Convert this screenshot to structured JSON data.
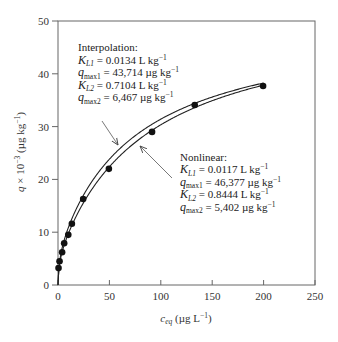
{
  "chart_data": {
    "type": "scatter",
    "title": "",
    "xlabel": "c_eq (µg L⁻¹)",
    "ylabel": "q × 10⁻³ (µg kg⁻¹)",
    "xlim": [
      0,
      250
    ],
    "ylim": [
      0,
      50
    ],
    "x_ticks": [
      0,
      50,
      100,
      150,
      200,
      250
    ],
    "y_ticks": [
      0,
      10,
      20,
      30,
      40,
      50
    ],
    "grid": false,
    "legend": "none (inline annotations with arrows)",
    "series": [
      {
        "name": "Observed data",
        "kind": "points",
        "x": [
          0.5,
          1.5,
          4,
          6,
          10,
          13.5,
          24.5,
          49.5,
          91.5,
          133,
          199.5
        ],
        "y": [
          3.2,
          4.5,
          6.2,
          7.9,
          9.5,
          11.6,
          16.3,
          22.0,
          29.0,
          34.1,
          37.7
        ]
      },
      {
        "name": "Interpolation",
        "kind": "curve",
        "model": "two-site Langmuir",
        "params": {
          "KL1": 0.0134,
          "qmax1": 43.714,
          "KL2": 0.7104,
          "qmax2": 6.467
        },
        "x_range": [
          0,
          200
        ]
      },
      {
        "name": "Nonlinear",
        "kind": "curve",
        "model": "two-site Langmuir",
        "params": {
          "KL1": 0.0117,
          "qmax1": 46.377,
          "KL2": 0.8444,
          "qmax2": 5.402
        },
        "x_range": [
          0,
          200
        ]
      }
    ],
    "annotations": [
      {
        "title": "Interpolation:",
        "lines": [
          {
            "sym": "K",
            "sub": "L1",
            "val": " = 0.0134 L kg",
            "sup": "−1"
          },
          {
            "sym": "q",
            "sub": "max1",
            "val": " = 43,714 µg kg",
            "sup": "−1"
          },
          {
            "sym": "K",
            "sub": "L2",
            "val": " = 0.7104 L kg",
            "sup": "−1"
          },
          {
            "sym": "q",
            "sub": "max2",
            "val": " = 6,467 µg kg",
            "sup": "−1"
          }
        ]
      },
      {
        "title": "Nonlinear:",
        "lines": [
          {
            "sym": "K",
            "sub": "L1",
            "val": " = 0.0117 L kg",
            "sup": "−1"
          },
          {
            "sym": "q",
            "sub": "max1",
            "val": " = 46,377 µg kg",
            "sup": "−1"
          },
          {
            "sym": "K",
            "sub": "L2",
            "val": " = 0.8444 L kg",
            "sup": "−1"
          },
          {
            "sym": "q",
            "sub": "max2",
            "val": " = 5,402 µg kg",
            "sup": "−1"
          }
        ]
      }
    ]
  },
  "labels": {
    "x_axis": {
      "sym": "c",
      "sub": "eq",
      "rest": " (µg L",
      "sup": "−1",
      "close": ")"
    },
    "y_axis": {
      "sym": "q",
      "mid": " × 10",
      "sup1": "−3",
      "rest": " (µg kg",
      "sup2": "−1",
      "close": ")"
    }
  },
  "colors": {
    "axis": "#555555",
    "curve": "#222222",
    "point": "#111111"
  }
}
